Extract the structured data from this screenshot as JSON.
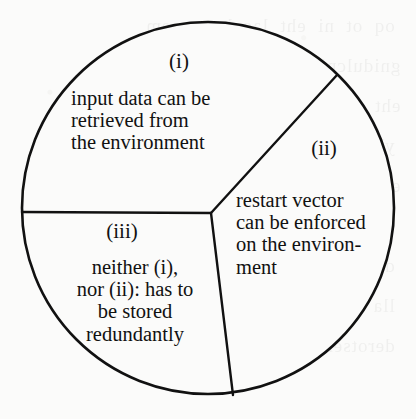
{
  "figure": {
    "kind": "venn-like-partition-circle",
    "stroke_color": "#111111",
    "fill_color": "#fbfbfa",
    "circle": {
      "cx": 208,
      "cy": 208,
      "r": 186
    },
    "junction": {
      "x": 211,
      "y": 213
    },
    "dividers": [
      {
        "name": "divider-left-horizontal",
        "to_x": 22,
        "to_y": 212
      },
      {
        "name": "divider-upper-right",
        "to_x": 337,
        "to_y": 75
      },
      {
        "name": "divider-lower",
        "to_x": 233,
        "to_y": 395
      }
    ]
  },
  "sectors": [
    {
      "id": "i",
      "label": "(i)",
      "text": "input data can be\nretrieved from\nthe environment",
      "align": "left"
    },
    {
      "id": "ii",
      "label": "(ii)",
      "text": "restart vector\ncan be enforced\non the environ-\nment",
      "align": "left"
    },
    {
      "id": "iii",
      "label": "(iii)",
      "text": "neither (i),\nnor (ii): has to\nbe stored\nredundantly",
      "align": "center"
    }
  ],
  "scan_artifact": {
    "bleed_through_text": "   oq  ot  ni  eht  lacol  yromem   \n  gnidulcni  eht  tnemnorivne  fo  \n  eht  tnetnoc  fo  eht  erutcurts  \n   yb  gnisu  eht  trats  rotcev  ot \n  eromhcum  elbissop  ot  erots  eht \n   tnadnuder  yletarapes  ereh  dna \n   deriuqer  taht  eht  atad  si  ton \n   lla  fo  eht  tupni  atad  nac  eb  \n   derotser  morf  eht  tnemnorivne"
  }
}
